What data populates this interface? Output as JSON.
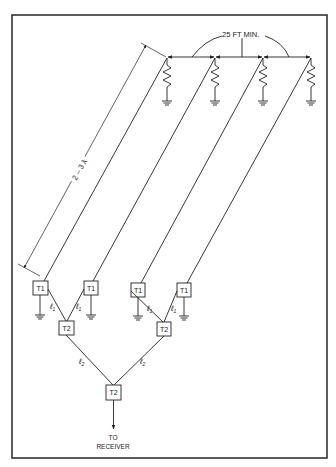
{
  "diagram": {
    "spacing_label": "25 FT MIN.",
    "length_label": "2 – 3 λ",
    "t1_label": "T1",
    "t2_label": "T2",
    "l1_label": "ℓ",
    "l1_sub": "1",
    "l2_label": "ℓ",
    "l2_sub": "2",
    "output_label_line1": "TO",
    "output_label_line2": "RECEIVER",
    "elements": [
      {
        "name": "element-1",
        "top_x": 167,
        "t1_x": 40
      },
      {
        "name": "element-2",
        "top_x": 215,
        "t1_x": 90
      },
      {
        "name": "element-3",
        "top_x": 263,
        "t1_x": 138
      },
      {
        "name": "element-4",
        "top_x": 311,
        "t1_x": 184
      }
    ],
    "colors": {
      "line": "#222222",
      "frame": "#333333",
      "background": "#ffffff"
    }
  }
}
